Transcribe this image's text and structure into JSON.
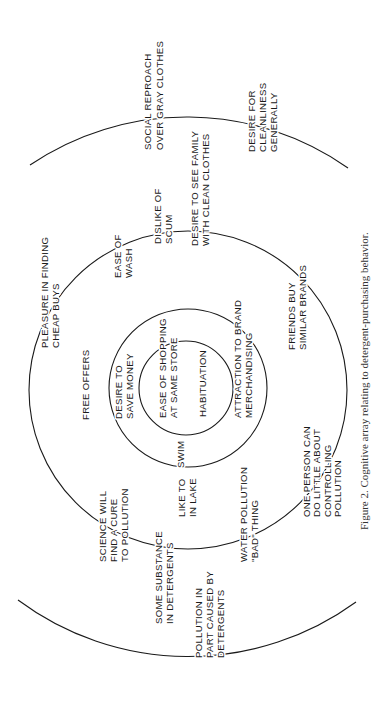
{
  "figure": {
    "caption": "Figure 2.  Cognitive array relating to detergent-purchasing behavior.",
    "orientation": "rotated 90° counter-clockwise",
    "rings": [
      {
        "name": "inner",
        "labels": [
          {
            "lines": [
              "HABITUATION"
            ]
          },
          {
            "lines": [
              "EASE OF SHOPPING",
              "AT SAME STORE"
            ]
          }
        ]
      },
      {
        "name": "second",
        "labels": [
          {
            "lines": [
              "DESIRE TO",
              "SAVE MONEY"
            ]
          },
          {
            "lines": [
              "ATTRACTION  TO  BRAND",
              "MERCHANDISING"
            ]
          },
          {
            "lines": [
              "SWIM"
            ]
          }
        ]
      },
      {
        "name": "third",
        "labels": [
          {
            "lines": [
              "FREE  OFFERS"
            ]
          },
          {
            "lines": [
              "PLEASURE  IN  FINDING",
              "CHEAP  BUYS"
            ]
          },
          {
            "lines": [
              "EASE  OF",
              "WASH"
            ]
          },
          {
            "lines": [
              "DISLIKE  OF",
              "SCUM"
            ]
          },
          {
            "lines": [
              "DESIRE  TO  SEE  FAMILY",
              "WITH  CLEAN  CLOTHES"
            ]
          },
          {
            "lines": [
              "FRIENDS  BUY",
              "SIMILAR  BRANDS"
            ]
          },
          {
            "lines": [
              "ONE  PERSON  CAN",
              "DO  LITTLE  ABOUT",
              "CONTROLLING",
              "POLLUTION"
            ]
          },
          {
            "lines": [
              "LIKE  TO",
              "IN  LAKE"
            ]
          },
          {
            "lines": [
              "WATER  POLLUTION",
              "\"BAD\" THING"
            ]
          },
          {
            "lines": [
              "SCIENCE  WILL",
              "FIND  A  CURE",
              "TO  POLLUTION"
            ]
          },
          {
            "lines": [
              "SOME  SUBSTANCE",
              "IN  DETERGENTS"
            ]
          }
        ]
      },
      {
        "name": "outer",
        "labels": [
          {
            "lines": [
              "SOCIAL  REPROACH",
              "OVER  GRAY  CLOTHES"
            ]
          },
          {
            "lines": [
              "DESIRE  FOR",
              "CLEANLINESS",
              "GENERALLY"
            ]
          },
          {
            "lines": [
              "POLLUTION  IN",
              "PART  CAUSED  BY",
              "DETERGENTS"
            ]
          }
        ]
      }
    ]
  }
}
